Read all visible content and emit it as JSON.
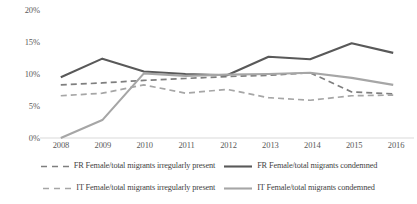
{
  "chart_data": {
    "type": "line",
    "title": "",
    "xlabel": "",
    "ylabel": "",
    "categories": [
      "2008",
      "2009",
      "2010",
      "2011",
      "2012",
      "2013",
      "2014",
      "2015",
      "2016"
    ],
    "x": [
      2008,
      2009,
      2010,
      2011,
      2012,
      2013,
      2014,
      2015,
      2016
    ],
    "ylim": [
      0,
      20
    ],
    "ytick_labels": [
      "0%",
      "5%",
      "10%",
      "15%",
      "20%"
    ],
    "ytick_values": [
      0,
      5,
      10,
      15,
      20
    ],
    "grid": false,
    "legend_position": "bottom",
    "series": [
      {
        "name": "FR Female/total migrants irregularly present",
        "key": "fr_irregular",
        "style": "dashed",
        "color": "#7f7f7f",
        "values": [
          8.3,
          8.6,
          9.0,
          9.3,
          9.6,
          9.8,
          10.2,
          7.2,
          6.9
        ]
      },
      {
        "name": "FR Female/total migrants condemned",
        "key": "fr_condemned",
        "style": "solid",
        "color": "#595959",
        "values": [
          9.5,
          12.4,
          10.4,
          10.0,
          9.8,
          12.7,
          12.3,
          14.8,
          13.3
        ]
      },
      {
        "name": "IT Female/total migrants irregularly present",
        "key": "it_irregular",
        "style": "dashed",
        "color": "#a6a6a6",
        "values": [
          6.6,
          7.0,
          8.3,
          7.0,
          7.6,
          6.3,
          5.9,
          6.6,
          6.7
        ]
      },
      {
        "name": "IT Female/total migrants condemned",
        "key": "it_condemned",
        "style": "solid",
        "color": "#a6a6a6",
        "values": [
          0.0,
          2.8,
          10.1,
          9.7,
          9.9,
          10.0,
          10.2,
          9.4,
          8.3
        ]
      }
    ]
  },
  "axes": {
    "y_labels": [
      "20%",
      "15%",
      "10%",
      "5%",
      "0%"
    ],
    "x_labels": [
      "2008",
      "2009",
      "2010",
      "2011",
      "2012",
      "2013",
      "2014",
      "2015",
      "2016"
    ]
  },
  "legend": {
    "rows": [
      [
        {
          "label": "FR Female/total migrants irregularly present",
          "style": "dashed",
          "color": "#7f7f7f"
        },
        {
          "label": "FR Female/total migrants condemned",
          "style": "solid",
          "color": "#595959"
        }
      ],
      [
        {
          "label": "IT Female/total migrants irregularly present",
          "style": "dashed",
          "color": "#a6a6a6"
        },
        {
          "label": "IT Female/total migrants condemned",
          "style": "solid",
          "color": "#a6a6a6"
        }
      ]
    ]
  },
  "colors": {
    "fr_dark": "#595959",
    "fr_dashed": "#7f7f7f",
    "it_light": "#a6a6a6",
    "axis_line": "#d9d9d9",
    "text": "#595959",
    "background": "#ffffff"
  }
}
